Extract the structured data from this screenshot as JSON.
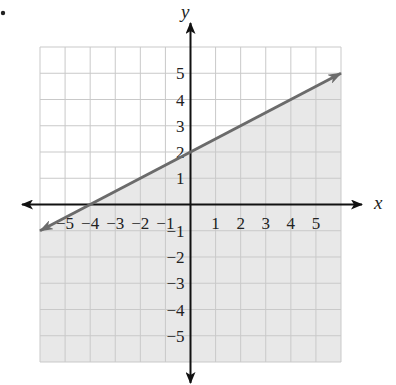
{
  "chart_data": {
    "type": "line",
    "title": "",
    "subtitle": "",
    "xlabel": "x",
    "ylabel": "y",
    "xlim": [
      -6,
      6
    ],
    "ylim": [
      -6,
      6
    ],
    "grid": true,
    "legend": null,
    "x_ticks": [
      -5,
      -4,
      -3,
      -2,
      -1,
      1,
      2,
      3,
      4,
      5
    ],
    "y_ticks": [
      5,
      4,
      3,
      2,
      1,
      -1,
      -2,
      -3,
      -4,
      -5
    ],
    "x_tick_labels": [
      "−5",
      "−4",
      "−3",
      "−2",
      "−1",
      "1",
      "2",
      "3",
      "4",
      "5"
    ],
    "y_tick_labels": [
      "5",
      "4",
      "3",
      "2",
      "1",
      "−1",
      "−2",
      "−3",
      "−4",
      "−5"
    ],
    "series": [
      {
        "name": "boundary line y = x/2 + 2",
        "style": "solid",
        "slope": 0.5,
        "intercept": 2,
        "x": [
          -6,
          6
        ],
        "y": [
          -1,
          5
        ],
        "arrows": "both"
      }
    ],
    "shaded_region": {
      "inequality": "y ≤ (1/2)x + 2",
      "side": "below",
      "color": "#e6e6e6"
    },
    "annotations": [
      "•"
    ]
  },
  "colors": {
    "axis": "#111111",
    "grid": "#c9c9c9",
    "line": "#6b6b6b",
    "shade": "#e8e8e8"
  }
}
